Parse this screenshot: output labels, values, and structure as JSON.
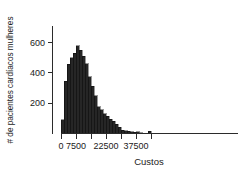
{
  "chart_data": {
    "type": "bar",
    "title": "",
    "subtitle": "",
    "xlabel": "Custos",
    "ylabel": "# de pacientes cardíacos mulheres",
    "xlim": [
      0,
      45000
    ],
    "ylim": [
      0,
      640
    ],
    "grid": false,
    "legend": null,
    "bin_width": 1500,
    "x_ticks": [
      {
        "value": 0,
        "label": "0"
      },
      {
        "value": 7500,
        "label": "7500"
      },
      {
        "value": 22500,
        "label": "22500"
      },
      {
        "value": 37500,
        "label": "37500"
      }
    ],
    "x_minor_ticks": [
      15000,
      30000,
      45000
    ],
    "y_ticks": [
      {
        "value": 200,
        "label": "200"
      },
      {
        "value": 400,
        "label": "400"
      },
      {
        "value": 600,
        "label": "600"
      }
    ],
    "bin_starts": [
      0,
      1500,
      3000,
      4500,
      6000,
      7500,
      9000,
      10500,
      12000,
      13500,
      15000,
      16500,
      18000,
      19500,
      21000,
      22500,
      24000,
      25500,
      27000,
      28500,
      30000,
      31500,
      33000,
      34500,
      36000,
      37500,
      39000,
      40500,
      42000,
      43500
    ],
    "categories": [
      "0",
      "1500",
      "3000",
      "4500",
      "6000",
      "7500",
      "9000",
      "10500",
      "12000",
      "13500",
      "15000",
      "16500",
      "18000",
      "19500",
      "21000",
      "22500",
      "24000",
      "25500",
      "27000",
      "28500",
      "30000",
      "31500",
      "33000",
      "34500",
      "36000",
      "37500",
      "39000",
      "40500",
      "42000",
      "43500"
    ],
    "values": [
      90,
      345,
      455,
      500,
      530,
      580,
      550,
      510,
      460,
      375,
      310,
      250,
      175,
      155,
      130,
      115,
      95,
      80,
      60,
      40,
      22,
      18,
      14,
      10,
      8,
      12,
      6,
      0,
      0,
      14
    ],
    "bar_color": "#262626",
    "axis_color": "#2b2b2b"
  },
  "axes": {
    "x_axis_title": "Custos",
    "y_axis_title": "# de pacientes cardíacos mulheres"
  }
}
